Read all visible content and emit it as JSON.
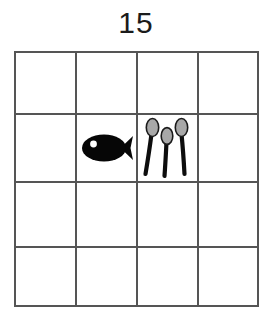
{
  "title": "15",
  "grid": {
    "rows": 4,
    "columns": 4,
    "line_color": "#555555",
    "background": "#ffffff",
    "column_edges_px": [
      14,
      76,
      137,
      198,
      259
    ],
    "row_edges_px": [
      51,
      114,
      182,
      247,
      307
    ]
  },
  "palette": {
    "ink": "#111111",
    "grid_line": "#555555",
    "spoon_head_fill": "#a8a8a8",
    "spoon_head_stroke": "#1a1a1a",
    "fish_body": "#060606",
    "fish_eye": "#ffffff",
    "title_color": "#1b1b1b",
    "page_background": "#ffffff"
  },
  "cells": [
    {
      "row": 1,
      "column": 1,
      "content": "empty",
      "label": ""
    },
    {
      "row": 1,
      "column": 2,
      "content": "empty",
      "label": ""
    },
    {
      "row": 1,
      "column": 3,
      "content": "empty",
      "label": ""
    },
    {
      "row": 1,
      "column": 4,
      "content": "empty",
      "label": ""
    },
    {
      "row": 2,
      "column": 1,
      "content": "empty",
      "label": ""
    },
    {
      "row": 2,
      "column": 2,
      "content": "fish",
      "label": "fish",
      "count": 1
    },
    {
      "row": 2,
      "column": 3,
      "content": "spoons",
      "label": "spoons",
      "count": 3
    },
    {
      "row": 2,
      "column": 4,
      "content": "empty",
      "label": ""
    },
    {
      "row": 3,
      "column": 1,
      "content": "empty",
      "label": ""
    },
    {
      "row": 3,
      "column": 2,
      "content": "empty",
      "label": ""
    },
    {
      "row": 3,
      "column": 3,
      "content": "empty",
      "label": ""
    },
    {
      "row": 3,
      "column": 4,
      "content": "empty",
      "label": ""
    },
    {
      "row": 4,
      "column": 1,
      "content": "empty",
      "label": ""
    },
    {
      "row": 4,
      "column": 2,
      "content": "empty",
      "label": ""
    },
    {
      "row": 4,
      "column": 3,
      "content": "empty",
      "label": ""
    },
    {
      "row": 4,
      "column": 4,
      "content": "empty",
      "label": ""
    }
  ],
  "icons": {
    "fish": "fish-icon",
    "spoon": "spoon-icon"
  }
}
